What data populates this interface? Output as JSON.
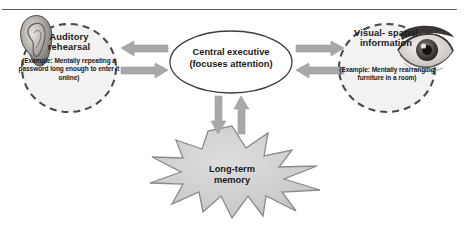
{
  "figure": {
    "colors": {
      "arrow_fill": "#a8a8a8",
      "arrow_stroke": "#8f8f8f",
      "circle_stroke": "#4a4a4a",
      "circle_fill": "#f2f2f2",
      "ellipse_stroke": "#3c3c3c",
      "ellipse_fill": "#ffffff",
      "star_fill": "#cfcfcf",
      "star_stroke": "#8a8a8a",
      "text": "#1a1a1a",
      "rule": "#5a5a5a"
    }
  },
  "nodes": {
    "auditory": {
      "heading": "Auditory rehearsal",
      "example": "(Example: Mentally repeating a password long enough to enter it online)",
      "icon": "ear-photo"
    },
    "central": {
      "label": "Central executive (focuses attention)"
    },
    "visual": {
      "heading": "Visual- spatial information",
      "example": "(Example: Mentally rearranging furniture in a room)",
      "icon": "eye-photo"
    },
    "longterm": {
      "label": "Long-term memory"
    }
  },
  "arrows": [
    {
      "name": "central-to-auditory",
      "direction": "left"
    },
    {
      "name": "auditory-to-central",
      "direction": "right"
    },
    {
      "name": "central-to-visual",
      "direction": "right"
    },
    {
      "name": "visual-to-central",
      "direction": "left"
    },
    {
      "name": "central-to-longterm",
      "direction": "down"
    },
    {
      "name": "longterm-to-central",
      "direction": "up"
    }
  ]
}
